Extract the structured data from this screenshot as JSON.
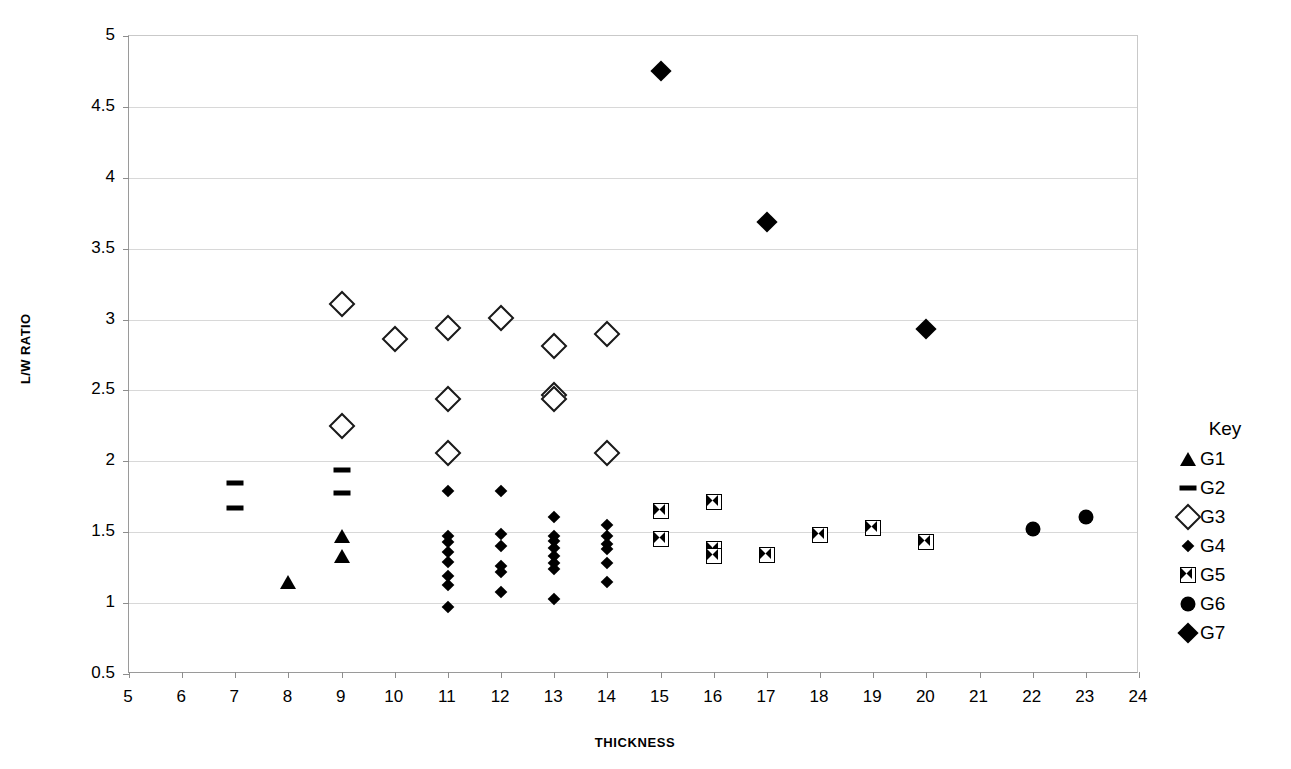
{
  "chart_data": {
    "type": "scatter",
    "title": "",
    "xlabel": "THICKNESS",
    "ylabel": "L/W RATIO",
    "xlim": [
      5,
      24
    ],
    "ylim": [
      0.5,
      5
    ],
    "xticks": [
      5,
      6,
      7,
      8,
      9,
      10,
      11,
      12,
      13,
      14,
      15,
      16,
      17,
      18,
      19,
      20,
      21,
      22,
      23,
      24
    ],
    "yticks": [
      0.5,
      1,
      1.5,
      2,
      2.5,
      3,
      3.5,
      4,
      4.5,
      5
    ],
    "xtick_labels": [
      "5",
      "6",
      "7",
      "8",
      "9",
      "10",
      "11",
      "12",
      "13",
      "14",
      "15",
      "16",
      "17",
      "18",
      "19",
      "20",
      "21",
      "22",
      "23",
      "24"
    ],
    "ytick_labels": [
      "0.5",
      "1",
      "1.5",
      "2",
      "2.5",
      "3",
      "3.5",
      "4",
      "4.5",
      "5"
    ],
    "grid": "horizontal",
    "legend_position": "right",
    "legend_title": "Key",
    "series": [
      {
        "name": "G1",
        "marker": "filled-triangle",
        "color": "#000000",
        "points": [
          {
            "x": 8,
            "y": 1.15
          },
          {
            "x": 9,
            "y": 1.47
          },
          {
            "x": 9,
            "y": 1.33
          }
        ]
      },
      {
        "name": "G2",
        "marker": "dash",
        "color": "#000000",
        "points": [
          {
            "x": 7,
            "y": 1.85
          },
          {
            "x": 7,
            "y": 1.67
          },
          {
            "x": 9,
            "y": 1.94
          },
          {
            "x": 9,
            "y": 1.78
          }
        ]
      },
      {
        "name": "G3",
        "marker": "open-diamond",
        "color": "#000000",
        "points": [
          {
            "x": 9,
            "y": 3.11
          },
          {
            "x": 9,
            "y": 2.25
          },
          {
            "x": 10,
            "y": 2.86
          },
          {
            "x": 11,
            "y": 2.94
          },
          {
            "x": 11,
            "y": 2.44
          },
          {
            "x": 11,
            "y": 2.06
          },
          {
            "x": 12,
            "y": 3.01
          },
          {
            "x": 13,
            "y": 2.81
          },
          {
            "x": 13,
            "y": 2.47
          },
          {
            "x": 13,
            "y": 2.44
          },
          {
            "x": 14,
            "y": 2.9
          },
          {
            "x": 14,
            "y": 2.06
          }
        ]
      },
      {
        "name": "G4",
        "marker": "small-filled-diamond",
        "color": "#000000",
        "points": [
          {
            "x": 11,
            "y": 1.79
          },
          {
            "x": 11,
            "y": 1.47
          },
          {
            "x": 11,
            "y": 1.43
          },
          {
            "x": 11,
            "y": 1.36
          },
          {
            "x": 11,
            "y": 1.29
          },
          {
            "x": 11,
            "y": 1.19
          },
          {
            "x": 11,
            "y": 1.13
          },
          {
            "x": 11,
            "y": 0.97
          },
          {
            "x": 12,
            "y": 1.79
          },
          {
            "x": 12,
            "y": 1.49
          },
          {
            "x": 12,
            "y": 1.4
          },
          {
            "x": 12,
            "y": 1.26
          },
          {
            "x": 12,
            "y": 1.22
          },
          {
            "x": 12,
            "y": 1.08
          },
          {
            "x": 13,
            "y": 1.61
          },
          {
            "x": 13,
            "y": 1.47
          },
          {
            "x": 13,
            "y": 1.44
          },
          {
            "x": 13,
            "y": 1.39
          },
          {
            "x": 13,
            "y": 1.33
          },
          {
            "x": 13,
            "y": 1.28
          },
          {
            "x": 13,
            "y": 1.24
          },
          {
            "x": 13,
            "y": 1.03
          },
          {
            "x": 14,
            "y": 1.55
          },
          {
            "x": 14,
            "y": 1.47
          },
          {
            "x": 14,
            "y": 1.42
          },
          {
            "x": 14,
            "y": 1.38
          },
          {
            "x": 14,
            "y": 1.28
          },
          {
            "x": 14,
            "y": 1.15
          }
        ]
      },
      {
        "name": "G5",
        "marker": "bowtie",
        "color": "#000000",
        "points": [
          {
            "x": 15,
            "y": 1.65
          },
          {
            "x": 15,
            "y": 1.45
          },
          {
            "x": 16,
            "y": 1.71
          },
          {
            "x": 16,
            "y": 1.38
          },
          {
            "x": 16,
            "y": 1.33
          },
          {
            "x": 17,
            "y": 1.34
          },
          {
            "x": 18,
            "y": 1.48
          },
          {
            "x": 19,
            "y": 1.53
          },
          {
            "x": 20,
            "y": 1.43
          }
        ]
      },
      {
        "name": "G6",
        "marker": "filled-circle",
        "color": "#000000",
        "points": [
          {
            "x": 22,
            "y": 1.52
          },
          {
            "x": 23,
            "y": 1.61
          }
        ]
      },
      {
        "name": "G7",
        "marker": "large-filled-diamond",
        "color": "#000000",
        "points": [
          {
            "x": 15,
            "y": 4.75
          },
          {
            "x": 17,
            "y": 3.69
          },
          {
            "x": 20,
            "y": 2.93
          }
        ]
      }
    ]
  },
  "axes": {
    "x_title": "THICKNESS",
    "y_title": "L/W RATIO"
  },
  "legend": {
    "title": "Key",
    "entries": [
      {
        "label": "G1",
        "marker": "filled-triangle"
      },
      {
        "label": "G2",
        "marker": "dash"
      },
      {
        "label": "G3",
        "marker": "open-diamond"
      },
      {
        "label": "G4",
        "marker": "small-filled-diamond"
      },
      {
        "label": "G5",
        "marker": "bowtie"
      },
      {
        "label": "G6",
        "marker": "filled-circle"
      },
      {
        "label": "G7",
        "marker": "large-filled-diamond"
      }
    ]
  }
}
